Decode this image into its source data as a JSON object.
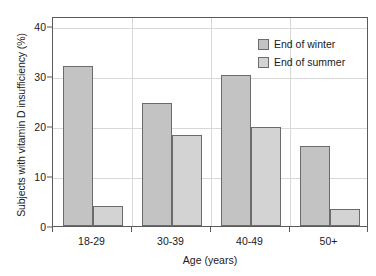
{
  "chart_data": {
    "type": "bar",
    "title": "",
    "subtitle": "",
    "xlabel": "Age (years)",
    "ylabel": "Subjects with vitamin D insufficiency (%)",
    "categories": [
      "18-29",
      "30-39",
      "40-49",
      "50+"
    ],
    "series": [
      {
        "name": "End of winter",
        "color": "#c3c3c3",
        "values": [
          32.0,
          24.6,
          30.2,
          15.9
        ]
      },
      {
        "name": "End of summer",
        "color": "#d3d3d3",
        "values": [
          4.0,
          18.2,
          19.7,
          3.4
        ]
      }
    ],
    "ylim": [
      0,
      42
    ],
    "yticks": [
      0,
      10,
      20,
      30,
      40
    ],
    "ytick_labels": [
      "0",
      "10",
      "20",
      "30",
      "40"
    ],
    "grid": {
      "horizontal": true,
      "vertical": true,
      "color": "#d8d8d8"
    },
    "legend": {
      "position": "top-right-inside",
      "entries": [
        "End of winter",
        "End of summer"
      ]
    },
    "axis_color": "#5a5a5a",
    "bar_edge_color": "#6b6b6b",
    "background": "#ffffff"
  }
}
